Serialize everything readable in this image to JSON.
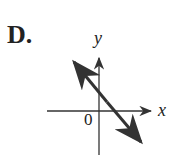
{
  "option_label": "D.",
  "axes": {
    "x_label": "x",
    "y_label": "y",
    "origin_label": "0"
  },
  "line": {
    "direction": "negative slope",
    "y_intercept": "positive",
    "x_intercept": "positive",
    "arrows": "both ends"
  },
  "colors": {
    "stroke": "#333333"
  }
}
